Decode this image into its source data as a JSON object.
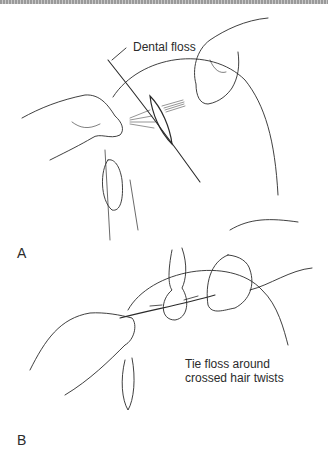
{
  "figure": {
    "panels": [
      {
        "letter": "A",
        "annotations": [
          {
            "text": "Dental floss"
          }
        ]
      },
      {
        "letter": "B",
        "annotations": [
          {
            "line1": "Tie floss around",
            "line2": "crossed hair twists"
          }
        ]
      }
    ],
    "colors": {
      "ink": "#2a2a2a",
      "background": "#ffffff",
      "top_rule": "#9a9a9a"
    }
  }
}
